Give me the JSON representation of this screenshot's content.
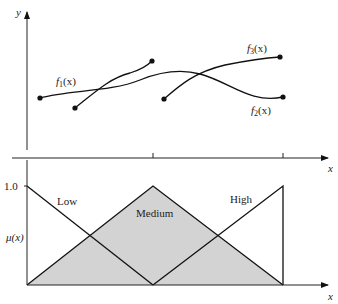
{
  "top_plot": {
    "y_label": "y",
    "x_label": "x",
    "curves": [
      {
        "name": "f1",
        "label_main": "f",
        "label_sub": "1",
        "label_tail": "(x)"
      },
      {
        "name": "f2",
        "label_main": "f",
        "label_sub": "2",
        "label_tail": "(x)"
      },
      {
        "name": "f3",
        "label_main": "f",
        "label_sub": "3",
        "label_tail": "(x)"
      }
    ]
  },
  "bottom_plot": {
    "y_label": "μ(x)",
    "y_tick": "1.0",
    "x_label": "x",
    "sets": [
      {
        "name": "low",
        "label": "Low"
      },
      {
        "name": "medium",
        "label": "Medium"
      },
      {
        "name": "high",
        "label": "High"
      }
    ],
    "fill_color": "#d3d3d3"
  }
}
